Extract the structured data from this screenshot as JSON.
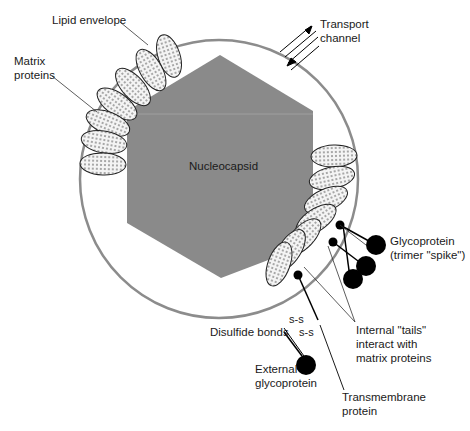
{
  "diagram": {
    "type": "enveloped virus structure",
    "colors": {
      "envelope": "#8c8c8c",
      "nucleocapsid": "#8a8a8a",
      "matrix_fill": "#f2f2f2",
      "glycoprotein": "#000000",
      "background": "#ffffff"
    },
    "labels": {
      "lipid_envelope": "Lipid envelope",
      "matrix_line1": "Matrix",
      "matrix_line2": "proteins",
      "transport_line1": "Transport",
      "transport_line2": "channel",
      "nucleocapsid": "Nucleocapsid",
      "glyco_line1": "Glycoprotein",
      "glyco_line2": "(trimer \"spike\")",
      "tails_line1": "Internal \"tails\"",
      "tails_line2": "interact with",
      "tails_line3": "matrix proteins",
      "disulfide": "Disulfide bonds",
      "ss1": "s-s",
      "ss2": "s-s",
      "external_line1": "External",
      "external_line2": "glycoprotein",
      "transmembrane_line1": "Transmembrane",
      "transmembrane_line2": "protein"
    }
  }
}
